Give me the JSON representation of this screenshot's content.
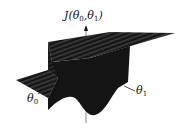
{
  "diagram": {
    "type": "3d-surface-plot",
    "z_axis_label": {
      "name": "J",
      "args": [
        "θ",
        "θ"
      ],
      "subs": [
        "0",
        "1"
      ],
      "text": "J(θ0,θ1)"
    },
    "x_axis_label": {
      "base": "θ",
      "sub": "0",
      "text": "θ0"
    },
    "y_axis_label": {
      "base": "θ",
      "sub": "1",
      "text": "θ1"
    },
    "colors": {
      "surface": "#141414",
      "stripe": "#3a3a3a",
      "axis": "#333333",
      "background": "#ffffff"
    }
  }
}
